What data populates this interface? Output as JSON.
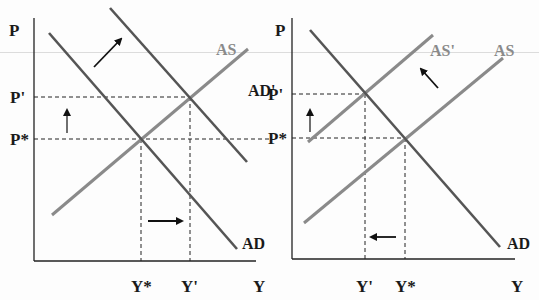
{
  "figure": {
    "colors": {
      "axis": "#222222",
      "ad_curve": "#555555",
      "as_curve": "#8a8a8a",
      "dashed_guides": "#222222",
      "arrows": "#111111",
      "labels": "#1a1a1a",
      "as_label": "#8a8a8a"
    }
  },
  "left_graph": {
    "y_axis_label": "P",
    "x_axis_label": "Y",
    "price_levels": [
      {
        "label": "P'"
      },
      {
        "label": "P*"
      }
    ],
    "output_levels": [
      {
        "label": "Y*"
      },
      {
        "label": "Y'"
      }
    ],
    "curves": [
      {
        "name": "AS",
        "label": "AS"
      },
      {
        "name": "AD'",
        "label": "AD'"
      },
      {
        "name": "AD",
        "label": "AD"
      }
    ],
    "arrows": [
      {
        "name": "demand-shift-arrow",
        "direction": "up-right"
      },
      {
        "name": "price-up-arrow",
        "direction": "up"
      },
      {
        "name": "output-right-arrow",
        "direction": "right"
      }
    ]
  },
  "right_graph": {
    "y_axis_label": "P",
    "x_axis_label": "Y",
    "price_levels": [
      {
        "label": "P'"
      },
      {
        "label": "P*"
      }
    ],
    "output_levels": [
      {
        "label": "Y'"
      },
      {
        "label": "Y*"
      }
    ],
    "curves": [
      {
        "name": "AS'",
        "label": "AS'"
      },
      {
        "name": "AS",
        "label": "AS"
      },
      {
        "name": "AD",
        "label": "AD"
      }
    ],
    "arrows": [
      {
        "name": "supply-shift-arrow",
        "direction": "up-left"
      },
      {
        "name": "price-up-arrow",
        "direction": "up"
      },
      {
        "name": "output-left-arrow",
        "direction": "left"
      }
    ]
  }
}
